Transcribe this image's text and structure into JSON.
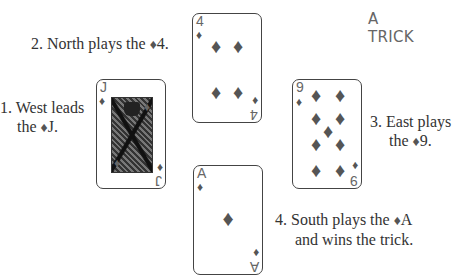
{
  "title": {
    "line1": "A",
    "line2": "TRICK"
  },
  "suit_symbol": "♦",
  "colors": {
    "diamond": "#555555",
    "text": "#333333",
    "title": "#666666",
    "card_border": "#444444"
  },
  "captions": {
    "west": {
      "line1": "1. West leads",
      "line2_prefix": "the ",
      "card": "J."
    },
    "north": {
      "line1_prefix": "2. North plays the ",
      "card": "4."
    },
    "east": {
      "line1": "3. East plays",
      "line2_prefix": "the ",
      "card": "9."
    },
    "south": {
      "line1_prefix": "4. South plays the ",
      "card": "A",
      "line2": "and wins the trick."
    }
  },
  "cards": {
    "west": {
      "rank": "J",
      "suit": "diamonds",
      "seat": "West",
      "order": 1
    },
    "north": {
      "rank": "4",
      "suit": "diamonds",
      "seat": "North",
      "order": 2
    },
    "east": {
      "rank": "9",
      "suit": "diamonds",
      "seat": "East",
      "order": 3
    },
    "south": {
      "rank": "A",
      "suit": "diamonds",
      "seat": "South",
      "order": 4,
      "winner": true
    }
  }
}
